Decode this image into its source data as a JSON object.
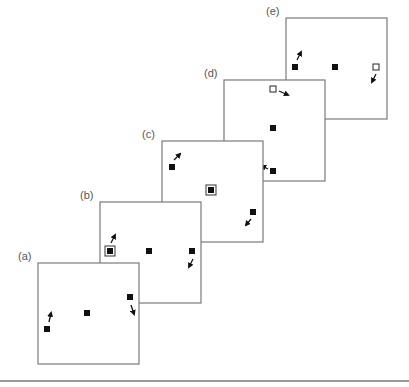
{
  "diagram": {
    "colors": {
      "frame": "#7a7a7a",
      "marker": "#111111",
      "label": "#555555",
      "rule": "#777777"
    },
    "panels": [
      {
        "id": "a",
        "label": "(a)",
        "box": [
          38,
          263,
          101,
          101
        ],
        "markers": [
          {
            "type": "filled",
            "x": 47,
            "y": 329,
            "arrow": [
              49,
              322,
              51,
              313
            ]
          },
          {
            "type": "filled",
            "x": 87,
            "y": 313
          },
          {
            "type": "filled",
            "x": 130,
            "y": 297,
            "arrow": [
              131,
              305,
              134,
              314
            ]
          }
        ]
      },
      {
        "id": "b",
        "label": "(b)",
        "box": [
          100,
          202,
          101,
          101
        ],
        "markers": [
          {
            "type": "ringed",
            "x": 110,
            "y": 251,
            "arrow": [
              111,
              243,
              115,
              235
            ]
          },
          {
            "type": "filled",
            "x": 149,
            "y": 251
          },
          {
            "type": "filled",
            "x": 192,
            "y": 251,
            "arrow": [
              193,
              259,
              189,
              267
            ]
          }
        ]
      },
      {
        "id": "c",
        "label": "(c)",
        "box": [
          162,
          141,
          101,
          101
        ],
        "markers": [
          {
            "type": "filled",
            "x": 172,
            "y": 167,
            "arrow": [
              174,
              160,
              180,
              154
            ]
          },
          {
            "type": "ringed",
            "x": 211,
            "y": 190
          },
          {
            "type": "filled",
            "x": 253,
            "y": 212,
            "arrow": [
              251,
              219,
              246,
              225
            ]
          }
        ]
      },
      {
        "id": "d",
        "label": "(d)",
        "box": [
          224,
          80,
          101,
          101
        ],
        "markers": [
          {
            "type": "open",
            "x": 273,
            "y": 89,
            "arrow": [
              279,
              91,
              288,
              95
            ]
          },
          {
            "type": "filled",
            "x": 273,
            "y": 128
          },
          {
            "type": "filled",
            "x": 273,
            "y": 171,
            "arrow": [
              268,
              169,
              262,
              166
            ]
          }
        ]
      },
      {
        "id": "e",
        "label": "(e)",
        "box": [
          286,
          18,
          101,
          101
        ],
        "markers": [
          {
            "type": "filled",
            "x": 295,
            "y": 67,
            "arrow": [
              297,
              60,
              301,
              52
            ]
          },
          {
            "type": "filled",
            "x": 335,
            "y": 67
          },
          {
            "type": "open",
            "x": 376,
            "y": 67,
            "arrow": [
              376,
              74,
              372,
              82
            ]
          }
        ]
      }
    ],
    "bottom_rule": {
      "x1": 0,
      "x2": 409,
      "y": 381
    }
  }
}
